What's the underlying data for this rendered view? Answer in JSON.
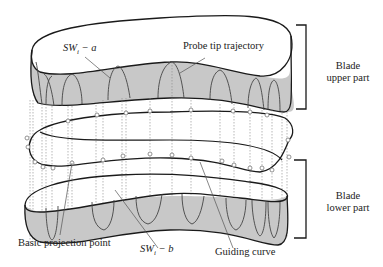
{
  "figure": {
    "type": "3D schematic of blade with probe trajectories",
    "colors": {
      "outline": "#1a1a1a",
      "band_fill": "#c8c8c8",
      "trajectory": "#444444",
      "dotted": "#888888",
      "marker": "#777777",
      "bracket": "#1a1a1a"
    }
  },
  "labels": {
    "sw_a": {
      "prefix": "SW",
      "sub": "i",
      "suffix": " − a"
    },
    "sw_b": {
      "prefix": "SW",
      "sub": "i",
      "suffix": " − b"
    },
    "probe_tip_trajectory": "Probe tip trajectory",
    "blade_upper_part_line1": "Blade",
    "blade_upper_part_line2": "upper part",
    "blade_lower_part_line1": "Blade",
    "blade_lower_part_line2": "lower part",
    "basic_projection_point": "Basic projection point",
    "guiding_curve": "Guiding curve"
  }
}
